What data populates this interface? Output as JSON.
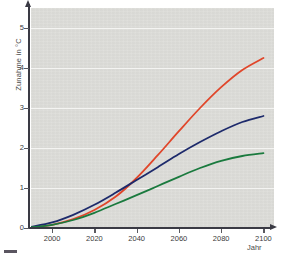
{
  "chart_data": {
    "type": "line",
    "title": "",
    "xlabel": "Jahr",
    "ylabel": "Zunahme in °C",
    "xlim": [
      1990,
      2105
    ],
    "ylim": [
      0,
      5.5
    ],
    "grid": true,
    "legend_position": "none",
    "xticks": [
      2000,
      2020,
      2040,
      2060,
      2080,
      2100
    ],
    "xtick_labels": [
      "2000",
      "2020",
      "2040",
      "2060",
      "2080",
      "2100"
    ],
    "yticks": [
      0,
      1,
      2,
      3,
      4,
      5
    ],
    "ytick_labels": [
      "0",
      "1",
      "2",
      "3",
      "4",
      "5"
    ],
    "x": [
      1990,
      2000,
      2010,
      2020,
      2030,
      2040,
      2050,
      2060,
      2070,
      2080,
      2090,
      2100
    ],
    "series": [
      {
        "name": "high-scenario",
        "color": "#e0462a",
        "values": [
          0.02,
          0.08,
          0.22,
          0.45,
          0.78,
          1.25,
          1.82,
          2.42,
          3.0,
          3.52,
          3.95,
          4.25
        ]
      },
      {
        "name": "mid-scenario",
        "color": "#1d2a6b",
        "values": [
          0.03,
          0.14,
          0.33,
          0.58,
          0.88,
          1.2,
          1.52,
          1.85,
          2.15,
          2.42,
          2.65,
          2.8
        ]
      },
      {
        "name": "low-scenario",
        "color": "#1a7a3e",
        "values": [
          0.02,
          0.08,
          0.2,
          0.38,
          0.6,
          0.82,
          1.05,
          1.28,
          1.5,
          1.68,
          1.8,
          1.87
        ]
      }
    ]
  },
  "axes": {
    "y_axis_title": "Zunahme in °C",
    "x_axis_title": "Jahr"
  },
  "colors": {
    "plot_background": "#dcdcd8",
    "gridline": "#f4f4f2",
    "axis": "#3a3a44",
    "tick_text": "#3b3b3b",
    "series_high": "#e0462a",
    "series_mid": "#1d2a6b",
    "series_low": "#1a7a3e"
  }
}
